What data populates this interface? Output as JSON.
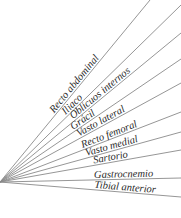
{
  "diagram": {
    "origin": {
      "x": 0,
      "y": 182
    },
    "line_color": "#8a8a8a",
    "text_color": "#2a2a2a",
    "muscles": [
      {
        "label": "Recto abdominal",
        "end": {
          "x": 150,
          "y": 0
        },
        "label_at": 0.37
      },
      {
        "label": "Iliaco",
        "end": {
          "x": 181,
          "y": 5
        },
        "label_at": 0.37
      },
      {
        "label": "Oblicuos internos",
        "end": {
          "x": 181,
          "y": 33
        },
        "label_at": 0.41
      },
      {
        "label": "Grácil",
        "end": {
          "x": 181,
          "y": 59
        },
        "label_at": 0.41
      },
      {
        "label": "Vasto lateral",
        "end": {
          "x": 181,
          "y": 83
        },
        "label_at": 0.44
      },
      {
        "label": "Recto femoral",
        "end": {
          "x": 181,
          "y": 112
        },
        "label_at": 0.46
      },
      {
        "label": "Vasto medial",
        "end": {
          "x": 181,
          "y": 132
        },
        "label_at": 0.48
      },
      {
        "label": "Sartorio",
        "end": {
          "x": 181,
          "y": 150
        },
        "label_at": 0.52
      },
      {
        "label": "Gastrocnemio",
        "end": {
          "x": 181,
          "y": 178
        },
        "label_at": 0.52
      },
      {
        "label": "Tibial anterior",
        "end": {
          "x": 181,
          "y": 197
        },
        "label_at": 0.52
      }
    ]
  }
}
